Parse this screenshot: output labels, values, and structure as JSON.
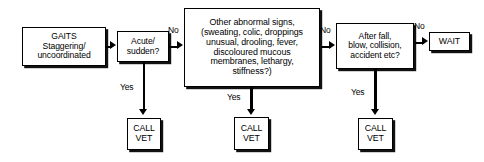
{
  "diagram": {
    "colors": {
      "ink": "#000000",
      "paper": "#ffffff",
      "shadow": "#111111"
    },
    "nodes": {
      "gaits": "GAITS\nStaggering/\nuncoordinated",
      "acute": "Acute/\nsudden?",
      "other_signs": "Other abnormal signs,\n(sweating, colic, droppings\nunusual, drooling, fever,\ndiscoloured mucous\nmembranes, lethargy,\nstiffness?)",
      "after_fall": "After fall,\nblow, collision,\naccident etc?",
      "wait": "WAIT",
      "call_vet_1": "CALL\nVET",
      "call_vet_2": "CALL\nVET",
      "call_vet_3": "CALL\nVET"
    },
    "edge_labels": {
      "no_acute": "No",
      "no_other": "No",
      "no_after_fall": "No",
      "yes_acute": "Yes",
      "yes_other": "Yes",
      "yes_after_fall": "Yes"
    }
  }
}
